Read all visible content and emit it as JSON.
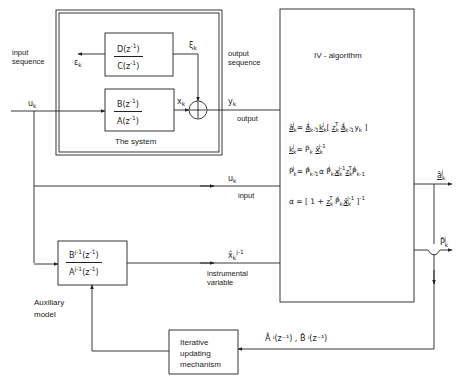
{
  "diagram": {
    "type": "block-diagram",
    "title": "IV - algorithm",
    "system": {
      "label": "The system",
      "noise_filter": {
        "numerator": "D(z⁻¹)",
        "denominator": "C(z⁻¹)",
        "input": "εk",
        "output": "ξk"
      },
      "plant": {
        "numerator": "B(z⁻¹)",
        "denominator": "A(z⁻¹)",
        "input": "uk",
        "output": "xk"
      },
      "sum_output": "yk"
    },
    "labels": {
      "input_sequence": "input sequence",
      "input_sequence_l1": "input",
      "input_sequence_l2": "sequence",
      "output_sequence_l1": "output",
      "output_sequence_l2": "sequence",
      "output": "output",
      "input": "input",
      "instrumental_l1": "instrumental",
      "instrumental_l2": "variable",
      "aux_l1": "Auxiliary",
      "aux_l2": "model",
      "iter_l1": "Iterative",
      "iter_l2": "updating",
      "iter_l3": "mechanism",
      "system": "The system",
      "algorithm": "IV - algorithm"
    },
    "signals": {
      "uk_in": "u",
      "uk_sub": "k",
      "eps": "ε",
      "xi": "ξ",
      "x": "x",
      "y": "y",
      "k": "k",
      "xhat": "x̂",
      "xhat_sup": "j-1",
      "ahat": "â",
      "phat": "P̂",
      "j": "j",
      "feedback": "Â ʲ(z⁻¹) , B̂ ʲ(z⁻¹)"
    },
    "blocks": {
      "DC_num": "D(z",
      "DC_den": "C(z",
      "BA_num": "B(z",
      "BA_den": "A(z",
      "aux_num_a": "B",
      "aux_den_a": "A",
      "aux_sup": "j-1",
      "aux_arg": "(z",
      "inv": "-1",
      "close": ")"
    },
    "equations": [
      "â_k^j = â_{k-1}^j - k_k^j [ z_k^T â_{k-1}^j - y_k ]",
      "k_k^j = P̂_k x̂_k^{j-1}",
      "P̂_k^j = P̂_{k-1}^j - α P̂_{k-1}^j x_k^{j-1} z_k^T P̂_{k-1}^j",
      "α = [ 1 + z_k^T P̂_{k-1}^j x̂_k^{j-1} ]^{-1}"
    ],
    "eq_parts": {
      "eq": "=",
      "minus": "-",
      "plus": "+",
      "lb": "[",
      "rb": "]",
      "alpha": "α",
      "one": "1",
      "T": "T",
      "km1": "k-1",
      "jm1": "j-1",
      "m1": "-1",
      "z": "z"
    },
    "outputs": [
      "â_k^j",
      "P̂_k^j"
    ]
  }
}
